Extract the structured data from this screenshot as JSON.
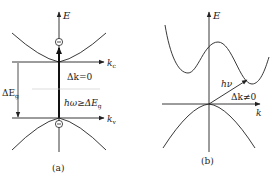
{
  "figure": {
    "panel_a": {
      "caption": "(a)",
      "energy_axis_label": "E",
      "conduction_axis_label": "k",
      "conduction_axis_sub": "c",
      "valence_axis_label": "k",
      "valence_axis_sub": "v",
      "gap_label": "ΔE",
      "gap_label_sub": "g",
      "momentum_label": "Δk=0",
      "photon_label": "hω≥ΔE",
      "photon_label_sub": "g",
      "electron_symbol": "−",
      "hole_symbol": "−",
      "description": "Direct band gap transition"
    },
    "panel_b": {
      "caption": "(b)",
      "energy_axis_label": "E",
      "k_axis_label": "k",
      "photon_label": "hν",
      "momentum_label": "Δk≠0",
      "description": "Indirect band gap transition"
    },
    "colors": {
      "stroke": "#222222",
      "faint_line": "#bbbbbb",
      "background": "#ffffff"
    }
  }
}
